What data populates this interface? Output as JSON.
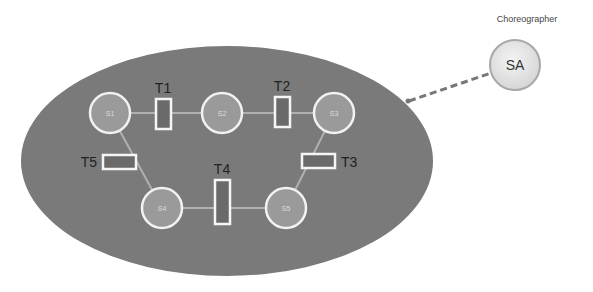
{
  "diagram": {
    "orchestrator": {
      "title": "Choreographer",
      "node_label": "SA",
      "connector_style": "dashed"
    },
    "region": {
      "shape": "ellipse",
      "fill": "#7a7a7a"
    },
    "states": [
      {
        "id": "S1",
        "label": "S1"
      },
      {
        "id": "S2",
        "label": "S2"
      },
      {
        "id": "S3",
        "label": "S3"
      },
      {
        "id": "S4",
        "label": "S4"
      },
      {
        "id": "S5",
        "label": "S5"
      }
    ],
    "transitions": [
      {
        "id": "T1",
        "label": "T1",
        "from": "S1",
        "to": "S2"
      },
      {
        "id": "T2",
        "label": "T2",
        "from": "S2",
        "to": "S3"
      },
      {
        "id": "T3",
        "label": "T3",
        "from": "S3",
        "to": "S5"
      },
      {
        "id": "T4",
        "label": "T4",
        "from": "S5",
        "to": "S4"
      },
      {
        "id": "T5",
        "label": "T5",
        "from": "S4",
        "to": "S1"
      }
    ],
    "colors": {
      "region": "#7a7a7a",
      "state_fill": "#9a9a9a",
      "state_stroke": "#f2f2f2",
      "transition_fill": "#6a6a6a",
      "transition_stroke": "#f5f5f5",
      "arc": "#b0b0b0",
      "sa_fill": "#e6e6e6",
      "sa_stroke": "#a8a8a8",
      "dash": "#777777"
    }
  }
}
